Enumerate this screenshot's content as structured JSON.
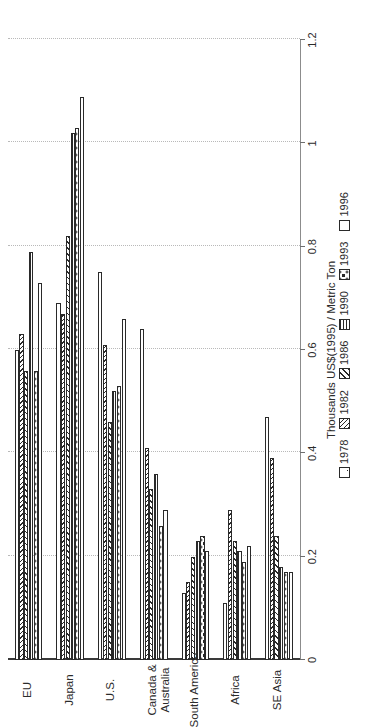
{
  "chart_data": {
    "type": "bar",
    "title": "",
    "xlabel": "",
    "ylabel": "Thousands US$(1995) / Metric Ton",
    "orientation": "horizontal",
    "grid": true,
    "legend_position": "bottom-right",
    "ylim": [
      0,
      1.2
    ],
    "tick_labels": [
      "0",
      "0.2",
      "0.4",
      "0.6",
      "0.8",
      "1",
      "1.2"
    ],
    "tick_values": [
      0,
      0.2,
      0.4,
      0.6,
      0.8,
      1,
      1.2
    ],
    "categories": [
      "EU",
      "Japan",
      "U.S.",
      "Canada &\nAustralia",
      "South America",
      "Africa",
      "SE Asia"
    ],
    "series": [
      {
        "name": "1978",
        "pattern": "sparse-dots",
        "values": [
          0.6,
          0.69,
          0.75,
          0.64,
          0.13,
          0.11,
          0.47
        ]
      },
      {
        "name": "1982",
        "pattern": "diagonal-hatch-right",
        "values": [
          0.63,
          0.67,
          0.61,
          0.41,
          0.15,
          0.29,
          0.39
        ]
      },
      {
        "name": "1986",
        "pattern": "diagonal-hatch-left",
        "values": [
          0.56,
          0.82,
          0.46,
          0.33,
          0.2,
          0.23,
          0.24
        ]
      },
      {
        "name": "1990",
        "pattern": "horizontal-lines",
        "values": [
          0.79,
          1.02,
          0.52,
          0.36,
          0.23,
          0.21,
          0.18
        ]
      },
      {
        "name": "1993",
        "pattern": "dense-dots",
        "values": [
          0.56,
          1.03,
          0.53,
          0.26,
          0.24,
          0.19,
          0.17
        ]
      },
      {
        "name": "1996",
        "pattern": "solid-white",
        "values": [
          0.73,
          1.09,
          0.66,
          0.29,
          0.21,
          0.22,
          0.17
        ]
      }
    ]
  },
  "legend": {
    "items": [
      {
        "label": "1978"
      },
      {
        "label": "1982"
      },
      {
        "label": "1986"
      },
      {
        "label": "1990"
      },
      {
        "label": "1993"
      },
      {
        "label": "1996"
      }
    ]
  }
}
